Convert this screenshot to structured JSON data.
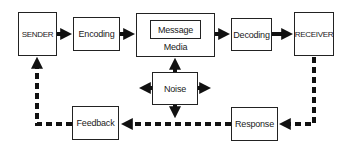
{
  "diagram": {
    "nodes": {
      "sender": "SENDER",
      "encoding": "Encoding",
      "message": "Message",
      "media": "Media",
      "decoding": "Decoding",
      "receiver": "RECEIVER",
      "noise": "Noise",
      "response": "Response",
      "feedback": "Feedback"
    },
    "edges": [
      {
        "from": "SENDER",
        "to": "Encoding",
        "style": "solid"
      },
      {
        "from": "Encoding",
        "to": "Media",
        "style": "solid"
      },
      {
        "from": "Media",
        "to": "Decoding",
        "style": "solid"
      },
      {
        "from": "Decoding",
        "to": "RECEIVER",
        "style": "solid"
      },
      {
        "from": "Noise",
        "to": "Media",
        "style": "solid"
      },
      {
        "from": "Noise",
        "to": "left",
        "style": "solid"
      },
      {
        "from": "Noise",
        "to": "right",
        "style": "solid"
      },
      {
        "from": "Noise",
        "to": "down",
        "style": "solid"
      },
      {
        "from": "RECEIVER",
        "to": "Response",
        "style": "dashed"
      },
      {
        "from": "Response",
        "to": "Feedback",
        "style": "dashed"
      },
      {
        "from": "Feedback",
        "to": "SENDER",
        "style": "dashed"
      }
    ],
    "colors": {
      "line": "#111111",
      "box_border": "#222222",
      "background": "#ffffff"
    }
  }
}
